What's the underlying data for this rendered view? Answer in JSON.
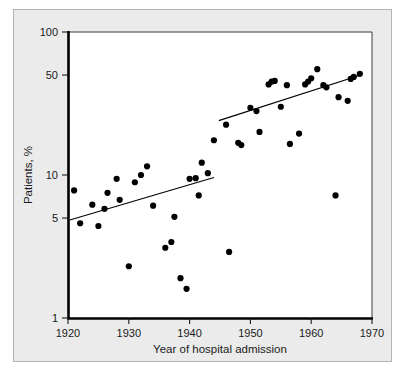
{
  "chart_data": {
    "type": "scatter",
    "title": "",
    "xlabel": "Year of hospital admission",
    "ylabel": "Patients, %",
    "xlim": [
      1920,
      1970
    ],
    "ylim": [
      1,
      100
    ],
    "yscale": "log",
    "xscale": "linear",
    "grid": false,
    "legend": null,
    "xticks": [
      1920,
      1930,
      1940,
      1950,
      1960,
      1970
    ],
    "xtick_labels": [
      "1920",
      "1930",
      "1940",
      "1950",
      "1960",
      "1970"
    ],
    "yticks": [
      1,
      5,
      10,
      50,
      100
    ],
    "ytick_labels": [
      "1",
      "5",
      "10",
      "50",
      "100"
    ],
    "marker": "filled-circle",
    "marker_color": "#000000",
    "points": [
      {
        "x": 1921,
        "y": 7.8
      },
      {
        "x": 1922,
        "y": 4.6
      },
      {
        "x": 1924,
        "y": 6.2
      },
      {
        "x": 1925,
        "y": 4.4
      },
      {
        "x": 1926,
        "y": 5.8
      },
      {
        "x": 1926.5,
        "y": 7.5
      },
      {
        "x": 1928,
        "y": 9.4
      },
      {
        "x": 1928.5,
        "y": 6.7
      },
      {
        "x": 1930,
        "y": 2.3
      },
      {
        "x": 1931,
        "y": 8.9
      },
      {
        "x": 1932,
        "y": 10.0
      },
      {
        "x": 1933,
        "y": 11.5
      },
      {
        "x": 1934,
        "y": 6.1
      },
      {
        "x": 1936,
        "y": 3.1
      },
      {
        "x": 1937,
        "y": 3.4
      },
      {
        "x": 1937.5,
        "y": 5.1
      },
      {
        "x": 1938.5,
        "y": 1.9
      },
      {
        "x": 1939.5,
        "y": 1.6
      },
      {
        "x": 1940,
        "y": 9.4
      },
      {
        "x": 1941,
        "y": 9.5
      },
      {
        "x": 1941.5,
        "y": 7.2
      },
      {
        "x": 1942,
        "y": 12.2
      },
      {
        "x": 1943,
        "y": 10.3
      },
      {
        "x": 1944,
        "y": 17.5
      },
      {
        "x": 1946,
        "y": 22.5
      },
      {
        "x": 1946.5,
        "y": 2.9
      },
      {
        "x": 1948,
        "y": 16.8
      },
      {
        "x": 1948.5,
        "y": 16.2
      },
      {
        "x": 1950,
        "y": 29.5
      },
      {
        "x": 1951,
        "y": 28.0
      },
      {
        "x": 1951.5,
        "y": 20.0
      },
      {
        "x": 1953,
        "y": 43.0
      },
      {
        "x": 1953.5,
        "y": 45.0
      },
      {
        "x": 1954,
        "y": 45.5
      },
      {
        "x": 1955,
        "y": 30.0
      },
      {
        "x": 1956,
        "y": 42.5
      },
      {
        "x": 1956.5,
        "y": 16.5
      },
      {
        "x": 1958,
        "y": 19.5
      },
      {
        "x": 1959,
        "y": 43.0
      },
      {
        "x": 1959.5,
        "y": 45.0
      },
      {
        "x": 1960,
        "y": 47.5
      },
      {
        "x": 1961,
        "y": 55.0
      },
      {
        "x": 1962,
        "y": 42.5
      },
      {
        "x": 1962.5,
        "y": 41.0
      },
      {
        "x": 1964,
        "y": 7.2
      },
      {
        "x": 1964.5,
        "y": 35.0
      },
      {
        "x": 1966,
        "y": 33.0
      },
      {
        "x": 1966.5,
        "y": 47.0
      },
      {
        "x": 1967,
        "y": 48.5
      },
      {
        "x": 1968,
        "y": 51.0
      }
    ],
    "fit_lines": [
      {
        "name": "regression-1920-1945",
        "x_start": 1920.3,
        "y_start": 4.85,
        "x_end": 1944.0,
        "y_end": 9.6,
        "color": "#000000"
      },
      {
        "name": "regression-1945-1968",
        "x_start": 1944.8,
        "y_start": 24.0,
        "x_end": 1968.4,
        "y_end": 50.5,
        "color": "#000000"
      }
    ]
  },
  "axes": {
    "x_title": "Year of hospital admission",
    "y_title": "Patients, %"
  },
  "colors": {
    "panel_background": "#ebebeb",
    "plot_background": "#ffffff",
    "axis": "#000000",
    "marker": "#000000",
    "text": "#1a1a1a"
  }
}
